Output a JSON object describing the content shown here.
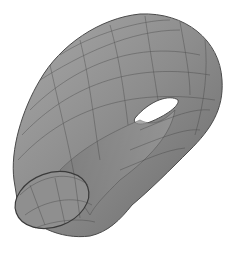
{
  "figure": {
    "colors": {
      "background": "#ffffff",
      "surface": "#8a8a8a",
      "surface_light": "#a6a6a6",
      "surface_dark": "#5e5e5e",
      "mesh": "#3a3a3a"
    }
  }
}
